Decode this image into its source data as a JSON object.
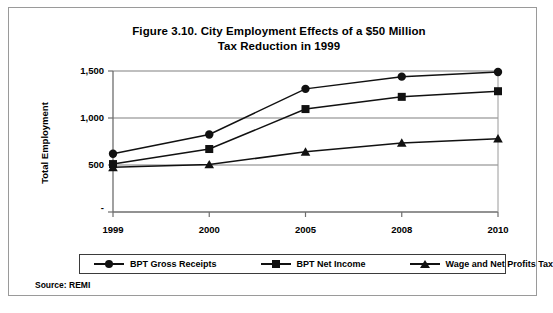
{
  "figure": {
    "title_line1": "Figure 3.10. City Employment Effects of a $50 Million",
    "title_line2": "Tax Reduction in 1999",
    "source_note": "Source: REMI",
    "border_color": "#9a9a9a"
  },
  "chart_data": {
    "type": "line",
    "title": "Figure 3.10. City Employment Effects of a $50 Million Tax Reduction in 1999",
    "xlabel": "",
    "ylabel": "Total Employment",
    "categories": [
      "1999",
      "2000",
      "2005",
      "2008",
      "2010"
    ],
    "ylim": [
      0,
      1500
    ],
    "yticks": [
      0,
      500,
      1000,
      1500
    ],
    "ytick_labels": [
      "-",
      "500",
      "1,000",
      "1,500"
    ],
    "grid": "horizontal",
    "legend_position": "bottom",
    "series": [
      {
        "name": "BPT Gross Receipts",
        "marker": "circle",
        "values": [
          620,
          825,
          1310,
          1440,
          1490
        ]
      },
      {
        "name": "BPT Net Income",
        "marker": "square",
        "values": [
          510,
          670,
          1095,
          1225,
          1285
        ]
      },
      {
        "name": "Wage and Net Profits Tax",
        "marker": "triangle",
        "values": [
          475,
          505,
          640,
          735,
          780
        ]
      }
    ],
    "series_color": "#111111",
    "gridline_color": "#808080"
  }
}
